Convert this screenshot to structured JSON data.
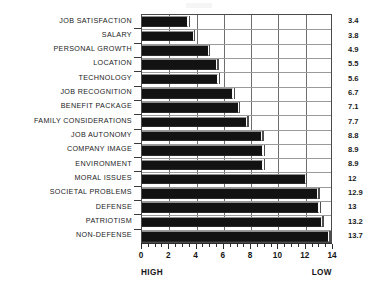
{
  "chart_data": {
    "type": "bar",
    "orientation": "horizontal",
    "title": "",
    "xlabel": "",
    "ylabel": "",
    "xlim": [
      0,
      14
    ],
    "grid": true,
    "legend": null,
    "axis_annotations": {
      "left": "HIGH",
      "right": "LOW"
    },
    "x_major_step": 2,
    "x_minor_step": 0.5,
    "x_tick_labels": [
      "0",
      "2",
      "4",
      "6",
      "8",
      "10",
      "12",
      "14"
    ],
    "x_tick_values": [
      0,
      2,
      4,
      6,
      8,
      10,
      12,
      14
    ],
    "categories": [
      "JOB SATISFACTION",
      "SALARY",
      "PERSONAL GROWTH",
      "LOCATION",
      "TECHNOLOGY",
      "JOB RECOGNITION",
      "BENEFIT PACKAGE",
      "FAMILY CONSIDERATIONS",
      "JOB AUTONOMY",
      "COMPANY IMAGE",
      "ENVIRONMENT",
      "MORAL ISSUES",
      "SOCIETAL PROBLEMS",
      "DEFENSE",
      "PATRIOTISM",
      "NON-DEFENSE"
    ],
    "values": [
      3.4,
      3.8,
      4.9,
      5.5,
      5.6,
      6.7,
      7.1,
      7.7,
      8.8,
      8.9,
      8.9,
      12,
      12.9,
      13,
      13.2,
      13.7
    ],
    "value_labels": [
      "3.4",
      "3.8",
      "4.9",
      "5.5",
      "5.6",
      "6.7",
      "7.1",
      "7.7",
      "8.8",
      "8.9",
      "8.9",
      "12",
      "12.9",
      "13",
      "13.2",
      "13.7"
    ]
  },
  "colors": {
    "bar_fill": "#121212",
    "bar_highlight": "#8e8e8e",
    "bar_cap": "#fbfbfb",
    "grid": "#6e6e6e",
    "row_grid": "#9a9a9a",
    "axis": "#2c2c2c",
    "text": "#1b1b1b",
    "background": "#ffffff"
  }
}
